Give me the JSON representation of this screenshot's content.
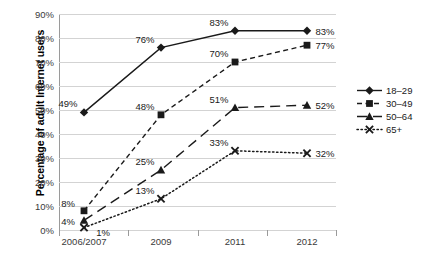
{
  "chart_data": {
    "type": "line",
    "title": "",
    "xlabel": "",
    "ylabel": "Percentage of adult Internet users",
    "categories": [
      "2006/2007",
      "2009",
      "2011",
      "2012"
    ],
    "ylim": [
      0,
      90
    ],
    "ytick_step": 10,
    "ytick_labels": [
      "0%",
      "10%",
      "20%",
      "30%",
      "40%",
      "50%",
      "60%",
      "70%",
      "80%",
      "90%"
    ],
    "ytick_values": [
      0,
      10,
      20,
      30,
      40,
      50,
      60,
      70,
      80,
      90
    ],
    "grid": true,
    "legend_position": "right",
    "value_labels": true,
    "series": [
      {
        "name": "18–29",
        "values": [
          49,
          76,
          83,
          83
        ],
        "labels": [
          "49%",
          "76%",
          "83%",
          "83%"
        ],
        "marker": "diamond",
        "line_style": "solid",
        "color": "#1a1a1a"
      },
      {
        "name": "30–49",
        "values": [
          8,
          48,
          70,
          77
        ],
        "labels": [
          "8%",
          "48%",
          "70%",
          "77%"
        ],
        "marker": "square",
        "line_style": "dashed",
        "color": "#1a1a1a"
      },
      {
        "name": "50–64",
        "values": [
          4,
          25,
          51,
          52
        ],
        "labels": [
          "4%",
          "25%",
          "51%",
          "52%"
        ],
        "marker": "triangle",
        "line_style": "long-dash",
        "color": "#1a1a1a"
      },
      {
        "name": "65+",
        "values": [
          1,
          13,
          33,
          32
        ],
        "labels": [
          "1%",
          "13%",
          "33%",
          "32%"
        ],
        "marker": "x",
        "line_style": "dotted",
        "color": "#1a1a1a"
      }
    ]
  },
  "colors": {
    "gridline": "#d3d3d3",
    "axis": "#7a7a7a",
    "background": "#ffffff",
    "text": "#1a1a1a"
  }
}
